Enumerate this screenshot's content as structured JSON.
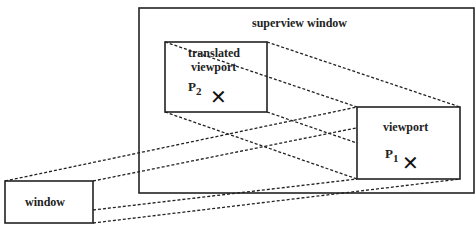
{
  "diagram": {
    "type": "viewport-translation",
    "boxes": {
      "superview": {
        "label": "superview window"
      },
      "translated_viewport": {
        "label_line1": "translated",
        "label_line2": "viewport",
        "point": "P",
        "point_sub": "2"
      },
      "viewport": {
        "label": "viewport",
        "point": "P",
        "point_sub": "1"
      },
      "window": {
        "label": "window"
      }
    },
    "marker_glyph": "✕",
    "colors": {
      "stroke": "#222222",
      "background": "#ffffff"
    }
  }
}
